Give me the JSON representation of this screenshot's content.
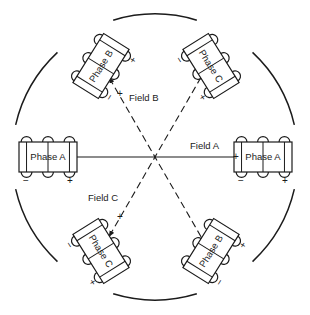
{
  "diagram": {
    "stator": {
      "name": "stator-circle",
      "center_x": 155,
      "center_y": 157,
      "radius": 143,
      "stroke": "#1b1b1b"
    },
    "coils": [
      {
        "id": "phase-a-left",
        "label": "Phase A",
        "angle_deg": 180,
        "rotation_deg": 0,
        "terminal_left": "−",
        "terminal_right": "+",
        "loops": 3,
        "cx": 48,
        "cy": 157
      },
      {
        "id": "phase-a-right",
        "label": "Phase A",
        "angle_deg": 0,
        "rotation_deg": 0,
        "terminal_left": "−",
        "terminal_right": "+",
        "loops": 3,
        "cx": 263,
        "cy": 157
      },
      {
        "id": "phase-b-upper-left",
        "label": "Phase B",
        "angle_deg": 120,
        "rotation_deg": -58,
        "terminal_left": "−",
        "terminal_right": "+",
        "loops": 3,
        "cx": 101,
        "cy": 66
      },
      {
        "id": "phase-c-upper-right",
        "label": "Phase C",
        "angle_deg": 60,
        "rotation_deg": 58,
        "terminal_left": "−",
        "terminal_right": "+",
        "loops": 3,
        "cx": 211,
        "cy": 66
      },
      {
        "id": "phase-c-lower-left",
        "label": "Phase C",
        "angle_deg": 240,
        "rotation_deg": 58,
        "terminal_left": "−",
        "terminal_right": "+",
        "loops": 3,
        "cx": 101,
        "cy": 251
      },
      {
        "id": "phase-b-lower-right",
        "label": "Phase B",
        "angle_deg": 300,
        "rotation_deg": -58,
        "terminal_left": "−",
        "terminal_right": "+",
        "loops": 3,
        "cx": 211,
        "cy": 251
      }
    ],
    "fields": [
      {
        "id": "field-a",
        "label": "Field A",
        "style": "solid",
        "angle_deg": 0,
        "positive_sign": "+",
        "label_x": 190,
        "label_y": 140,
        "sign_x": 233,
        "sign_y": 152
      },
      {
        "id": "field-b",
        "label": "Field B",
        "style": "dashed",
        "angle_deg": 120,
        "positive_sign": "+",
        "label_x": 129,
        "label_y": 92,
        "sign_x": 117,
        "sign_y": 89
      },
      {
        "id": "field-c",
        "label": "Field C",
        "style": "dashed",
        "angle_deg": 240,
        "positive_sign": "+",
        "label_x": 88,
        "label_y": 192,
        "sign_x": 117,
        "sign_y": 212
      }
    ]
  }
}
